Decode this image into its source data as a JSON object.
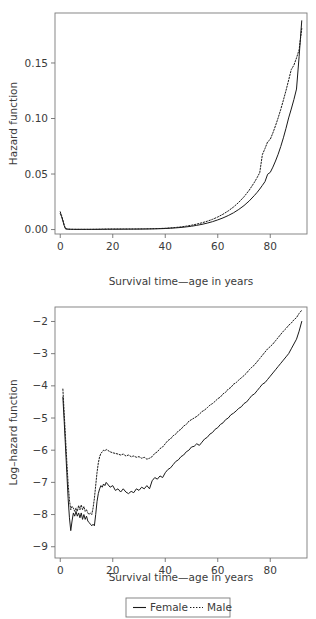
{
  "figure": {
    "background": "#ffffff",
    "ink_color": "#231f20"
  },
  "legend": {
    "name": "chart-legend",
    "entries": [
      {
        "label": "Female",
        "style": "solid",
        "icon": "solid-line-icon"
      },
      {
        "label": "Male",
        "style": "dotted",
        "icon": "dotted-line-icon"
      }
    ]
  },
  "chart_data": [
    {
      "id": "hazard-function-chart",
      "type": "line",
      "title": "",
      "xlabel": "Survival time—age in years",
      "ylabel": "Hazard function",
      "xlim": [
        -2,
        94
      ],
      "ylim": [
        -0.004,
        0.195
      ],
      "xticks": [
        0,
        20,
        40,
        60,
        80
      ],
      "xticklabels": [
        "0",
        "20",
        "40",
        "60",
        "80"
      ],
      "yticks": [
        0.0,
        0.05,
        0.1,
        0.15
      ],
      "yticklabels": [
        "0.00",
        "0.05",
        "0.10",
        "0.15"
      ],
      "grid": false,
      "legend_position": "below-figure",
      "series": [
        {
          "name": "Female",
          "style": "solid",
          "x": [
            0,
            0.5,
            1,
            1.5,
            2,
            3,
            4,
            5,
            6,
            8,
            10,
            12,
            14,
            16,
            18,
            20,
            22,
            24,
            26,
            28,
            30,
            32,
            34,
            36,
            38,
            40,
            42,
            44,
            46,
            48,
            50,
            52,
            54,
            56,
            58,
            60,
            62,
            64,
            66,
            68,
            70,
            72,
            74,
            75,
            76,
            77,
            78,
            79,
            80,
            81,
            82,
            83,
            84,
            85,
            86,
            87,
            88,
            89,
            90,
            91,
            92
          ],
          "values": [
            0.0145,
            0.0116,
            0.0078,
            0.0036,
            0.0006,
            0.0003,
            0.0002,
            0.00018,
            0.00016,
            0.00015,
            0.00015,
            0.00016,
            0.00018,
            0.0002,
            0.00024,
            0.00028,
            0.0003,
            0.00032,
            0.00035,
            0.00038,
            0.00042,
            0.00048,
            0.00055,
            0.00065,
            0.00078,
            0.00095,
            0.0012,
            0.0015,
            0.0019,
            0.0024,
            0.003,
            0.0038,
            0.0047,
            0.0058,
            0.0071,
            0.0087,
            0.0105,
            0.0126,
            0.0151,
            0.0181,
            0.0216,
            0.0258,
            0.0308,
            0.0335,
            0.0365,
            0.0398,
            0.0432,
            0.0498,
            0.0515,
            0.0562,
            0.0617,
            0.0678,
            0.0748,
            0.0826,
            0.0912,
            0.1005,
            0.1085,
            0.117,
            0.1265,
            0.156,
            0.188
          ]
        },
        {
          "name": "Male",
          "style": "dotted",
          "x": [
            0,
            0.5,
            1,
            1.5,
            2,
            3,
            4,
            5,
            6,
            8,
            10,
            12,
            14,
            16,
            18,
            20,
            22,
            24,
            26,
            28,
            30,
            32,
            34,
            36,
            38,
            40,
            42,
            44,
            46,
            48,
            50,
            52,
            54,
            56,
            58,
            60,
            62,
            64,
            66,
            68,
            70,
            72,
            74,
            75,
            76,
            77,
            78,
            79,
            80,
            81,
            82,
            83,
            84,
            85,
            86,
            87,
            88,
            89,
            90,
            91,
            92
          ],
          "values": [
            0.016,
            0.0128,
            0.0086,
            0.004,
            0.0008,
            0.0004,
            0.0003,
            0.00026,
            0.00024,
            0.00022,
            0.00023,
            0.00026,
            0.00032,
            0.00045,
            0.00052,
            0.00055,
            0.00056,
            0.00056,
            0.00055,
            0.00056,
            0.00058,
            0.00062,
            0.0007,
            0.0008,
            0.00095,
            0.0012,
            0.0015,
            0.0019,
            0.0024,
            0.0031,
            0.0039,
            0.0049,
            0.0061,
            0.0075,
            0.0092,
            0.0113,
            0.0138,
            0.0168,
            0.0203,
            0.0245,
            0.0295,
            0.0355,
            0.0427,
            0.0468,
            0.0513,
            0.0675,
            0.073,
            0.079,
            0.0812,
            0.087,
            0.0935,
            0.1005,
            0.1082,
            0.1165,
            0.1252,
            0.1345,
            0.144,
            0.148,
            0.1545,
            0.162,
            0.181
          ]
        }
      ]
    },
    {
      "id": "log-hazard-function-chart",
      "type": "line",
      "title": "",
      "xlabel": "Survival time—age in years",
      "ylabel": "Log–hazard function",
      "xlim": [
        -2,
        94
      ],
      "ylim": [
        -9.35,
        -1.55
      ],
      "xticks": [
        0,
        20,
        40,
        60,
        80
      ],
      "xticklabels": [
        "0",
        "20",
        "40",
        "60",
        "80"
      ],
      "yticks": [
        -2,
        -3,
        -4,
        -5,
        -6,
        -7,
        -8,
        -9
      ],
      "yticklabels": [
        "−2",
        "−3",
        "−4",
        "−5",
        "−6",
        "−7",
        "−8",
        "−9"
      ],
      "grid": false,
      "legend_position": "below-figure",
      "series": [
        {
          "name": "Female",
          "style": "solid",
          "x": [
            1,
            1.5,
            2,
            2.5,
            3,
            3.5,
            4,
            4.5,
            5,
            5.5,
            6,
            6.5,
            7,
            7.5,
            8,
            8.5,
            9,
            9.5,
            10,
            10.5,
            11,
            11.5,
            12,
            12.5,
            13,
            13.5,
            14,
            14.5,
            15,
            15.5,
            16,
            16.5,
            17,
            17.5,
            18,
            19,
            20,
            21,
            22,
            23,
            24,
            25,
            26,
            27,
            28,
            29,
            30,
            31,
            32,
            33,
            34,
            35,
            36,
            37,
            38,
            39,
            40,
            41,
            42,
            43,
            44,
            45,
            46,
            47,
            48,
            49,
            50,
            51,
            52,
            53,
            54,
            55,
            56,
            57,
            58,
            59,
            60,
            61,
            62,
            63,
            64,
            65,
            66,
            67,
            68,
            69,
            70,
            71,
            72,
            73,
            74,
            75,
            76,
            77,
            78,
            79,
            80,
            81,
            82,
            83,
            84,
            85,
            86,
            87,
            88,
            89,
            90,
            91,
            92
          ],
          "values": [
            -4.35,
            -5.1,
            -5.9,
            -6.7,
            -7.5,
            -8.1,
            -8.5,
            -8.2,
            -7.95,
            -8.05,
            -7.9,
            -8.05,
            -7.95,
            -8.1,
            -7.95,
            -8.15,
            -8.0,
            -8.15,
            -8.05,
            -8.2,
            -8.25,
            -8.3,
            -8.35,
            -8.3,
            -8.35,
            -8.0,
            -7.6,
            -7.35,
            -7.2,
            -7.1,
            -7.15,
            -7.05,
            -7.1,
            -7.0,
            -7.05,
            -7.15,
            -7.1,
            -7.25,
            -7.2,
            -7.3,
            -7.2,
            -7.3,
            -7.35,
            -7.28,
            -7.32,
            -7.2,
            -7.25,
            -7.15,
            -7.2,
            -7.1,
            -7.2,
            -6.95,
            -6.85,
            -6.9,
            -6.8,
            -6.85,
            -6.7,
            -6.6,
            -6.55,
            -6.45,
            -6.35,
            -6.3,
            -6.2,
            -6.15,
            -6.05,
            -6.0,
            -5.9,
            -5.88,
            -5.8,
            -5.85,
            -5.75,
            -5.65,
            -5.6,
            -5.5,
            -5.45,
            -5.35,
            -5.3,
            -5.2,
            -5.15,
            -5.05,
            -5.0,
            -4.9,
            -4.85,
            -4.78,
            -4.7,
            -4.65,
            -4.55,
            -4.5,
            -4.4,
            -4.3,
            -4.25,
            -4.15,
            -4.05,
            -3.95,
            -3.9,
            -3.8,
            -3.7,
            -3.6,
            -3.5,
            -3.4,
            -3.3,
            -3.2,
            -3.1,
            -3.0,
            -2.85,
            -2.7,
            -2.55,
            -2.3,
            -2.0,
            -1.8,
            -1.65
          ]
        },
        {
          "name": "Male",
          "style": "dotted",
          "x": [
            1,
            1.5,
            2,
            2.5,
            3,
            3.5,
            4,
            4.5,
            5,
            5.5,
            6,
            6.5,
            7,
            7.5,
            8,
            8.5,
            9,
            9.5,
            10,
            10.5,
            11,
            11.5,
            12,
            12.5,
            13,
            13.5,
            14,
            14.5,
            15,
            15.5,
            16,
            16.5,
            17,
            17.5,
            18,
            19,
            20,
            21,
            22,
            23,
            24,
            25,
            26,
            27,
            28,
            29,
            30,
            31,
            32,
            33,
            34,
            35,
            36,
            37,
            38,
            39,
            40,
            41,
            42,
            43,
            44,
            45,
            46,
            47,
            48,
            49,
            50,
            51,
            52,
            53,
            54,
            55,
            56,
            57,
            58,
            59,
            60,
            61,
            62,
            63,
            64,
            65,
            66,
            67,
            68,
            69,
            70,
            71,
            72,
            73,
            74,
            75,
            76,
            77,
            78,
            79,
            80,
            81,
            82,
            83,
            84,
            85,
            86,
            87,
            88,
            89,
            90,
            91,
            92
          ],
          "values": [
            -4.1,
            -4.85,
            -5.6,
            -6.35,
            -7.05,
            -7.55,
            -7.85,
            -7.75,
            -7.8,
            -7.9,
            -7.8,
            -7.9,
            -7.72,
            -7.85,
            -7.7,
            -7.85,
            -7.75,
            -7.9,
            -7.85,
            -7.95,
            -8.0,
            -7.95,
            -8.0,
            -7.8,
            -7.5,
            -7.1,
            -6.7,
            -6.4,
            -6.2,
            -6.1,
            -6.05,
            -6.0,
            -6.02,
            -5.98,
            -6.0,
            -6.05,
            -6.08,
            -6.1,
            -6.12,
            -6.15,
            -6.12,
            -6.18,
            -6.15,
            -6.2,
            -6.18,
            -6.22,
            -6.2,
            -6.25,
            -6.22,
            -6.28,
            -6.25,
            -6.2,
            -6.1,
            -6.05,
            -5.95,
            -5.9,
            -5.8,
            -5.7,
            -5.65,
            -5.55,
            -5.5,
            -5.4,
            -5.35,
            -5.25,
            -5.2,
            -5.1,
            -5.05,
            -5.0,
            -4.95,
            -4.88,
            -4.8,
            -4.75,
            -4.68,
            -4.6,
            -4.55,
            -4.48,
            -4.4,
            -4.35,
            -4.25,
            -4.2,
            -4.1,
            -4.05,
            -3.95,
            -3.9,
            -3.82,
            -3.75,
            -3.68,
            -3.6,
            -3.5,
            -3.42,
            -3.35,
            -3.25,
            -3.15,
            -3.05,
            -2.95,
            -2.85,
            -2.78,
            -2.7,
            -2.6,
            -2.5,
            -2.4,
            -2.3,
            -2.22,
            -2.12,
            -2.05,
            -1.95,
            -1.88,
            -1.75,
            -1.65
          ]
        }
      ]
    }
  ]
}
